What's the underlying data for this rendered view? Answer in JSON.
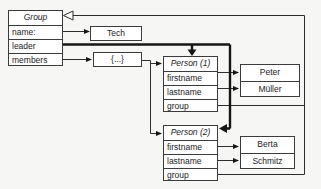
{
  "colors": {
    "background": "#f6f6f4",
    "box_fill": "#ffffff",
    "box_border": "#3b3b3b",
    "line": "#2e2e2e",
    "thick_line": "#161616"
  },
  "group": {
    "title": "Group",
    "fields": [
      "name:",
      "leader",
      "members"
    ]
  },
  "name_value": {
    "label": "Tech"
  },
  "members_collection": {
    "label": "{...}"
  },
  "person1": {
    "title": "Person (1)",
    "fields": [
      "firstname",
      "lastname",
      "group"
    ],
    "values": {
      "firstname": "Peter",
      "lastname": "Müller"
    }
  },
  "person2": {
    "title": "Person (2)",
    "fields": [
      "firstname",
      "lastname",
      "group"
    ],
    "values": {
      "firstname": "Berta",
      "lastname": "Schmitz"
    }
  }
}
